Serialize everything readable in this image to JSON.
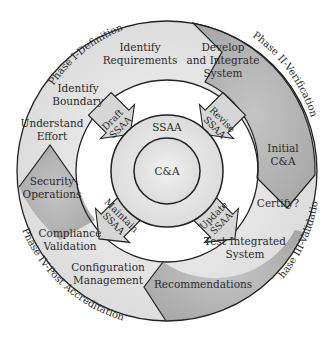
{
  "diagram": {
    "center": {
      "label": "C&A"
    },
    "middle_ring": {
      "label": "SSAA"
    },
    "phases": [
      {
        "label": "Phase I-Definition"
      },
      {
        "label": "Phase II-Verification"
      },
      {
        "label": "Phase III-Validation"
      },
      {
        "label": "Phase IV-Post Accreditation"
      }
    ],
    "steps": [
      {
        "line1": "Identify",
        "line2": "Requirements"
      },
      {
        "line1": "Identify",
        "line2": "Boundary"
      },
      {
        "line1": "Understand",
        "line2": "Effort"
      },
      {
        "line1": "Develop",
        "line2": "and Integrate",
        "line3": "System"
      },
      {
        "line1": "Initial",
        "line2": "C&A"
      },
      {
        "line1": "Certify?"
      },
      {
        "line1": "Test Integrated",
        "line2": "System"
      },
      {
        "line1": "Recommendations"
      },
      {
        "line1": "Configuration",
        "line2": "Management"
      },
      {
        "line1": "Compliance",
        "line2": "Validation"
      },
      {
        "line1": "Security",
        "line2": "Operations"
      }
    ],
    "arrows": [
      {
        "line1": "Draft",
        "line2": "SSAA"
      },
      {
        "line1": "Revise",
        "line2": "SSAA"
      },
      {
        "line1": "Update",
        "line2": "SSAA"
      },
      {
        "line1": "Maintain",
        "line2": "SSAA"
      }
    ],
    "colors": {
      "light_fill": "#e6e6e6",
      "dark_fill": "#b4b4b4",
      "stroke": "#222222"
    }
  }
}
